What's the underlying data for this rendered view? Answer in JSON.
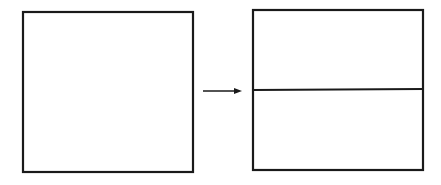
{
  "diagram": {
    "stroke_color": "#1a1a1a",
    "background": "#ffffff",
    "left_shape": {
      "type": "square",
      "label": ""
    },
    "arrow": {
      "direction": "right"
    },
    "right_shape": {
      "type": "rectangle",
      "divisions": 2,
      "divider": "horizontal"
    }
  }
}
